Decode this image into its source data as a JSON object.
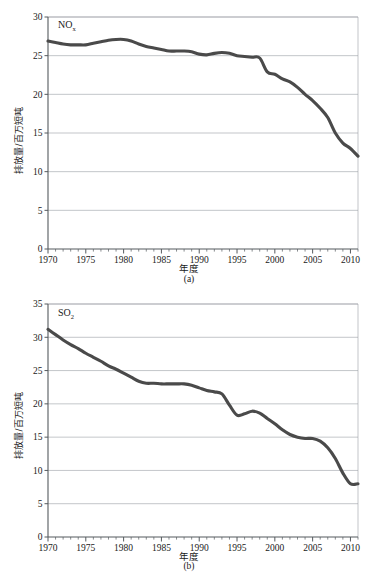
{
  "figure": {
    "panels": [
      {
        "caption": "(a)",
        "series_label_main": "NO",
        "series_label_sub": "x",
        "xlabel": "年度",
        "ylabel": "排放量/百万短吨"
      },
      {
        "caption": "(b)",
        "series_label_main": "SO",
        "series_label_sub": "2",
        "xlabel": "年度",
        "ylabel": "排放量/百万短吨"
      }
    ]
  },
  "chart_data": [
    {
      "type": "line",
      "title": "",
      "subtitle": "(a)",
      "xlabel": "年度",
      "ylabel": "排放量/百万短吨",
      "xlim": [
        1970,
        2011
      ],
      "ylim": [
        0,
        30
      ],
      "xticks": [
        1970,
        1975,
        1980,
        1985,
        1990,
        1995,
        2000,
        2005,
        2010
      ],
      "yticks": [
        0,
        5,
        10,
        15,
        20,
        25,
        30
      ],
      "xtick_minor_step": 1,
      "grid": "horizontal",
      "legend": "none",
      "annotations": [
        "NOx"
      ],
      "series": [
        {
          "name": "NOx",
          "color": "#4a4a4a",
          "x": [
            1970,
            1971,
            1972,
            1973,
            1974,
            1975,
            1976,
            1977,
            1978,
            1979,
            1980,
            1981,
            1982,
            1983,
            1984,
            1985,
            1986,
            1987,
            1988,
            1989,
            1990,
            1991,
            1992,
            1993,
            1994,
            1995,
            1996,
            1997,
            1998,
            1999,
            2000,
            2001,
            2002,
            2003,
            2004,
            2005,
            2006,
            2007,
            2008,
            2009,
            2010,
            2011
          ],
          "values": [
            26.9,
            26.7,
            26.5,
            26.4,
            26.4,
            26.4,
            26.6,
            26.8,
            27.0,
            27.1,
            27.1,
            26.9,
            26.5,
            26.2,
            26.0,
            25.8,
            25.6,
            25.6,
            25.6,
            25.5,
            25.2,
            25.1,
            25.3,
            25.4,
            25.3,
            25.0,
            24.9,
            24.8,
            24.7,
            22.9,
            22.6,
            22.0,
            21.6,
            20.9,
            20.0,
            19.2,
            18.2,
            17.0,
            15.0,
            13.7,
            13.0,
            12.0
          ]
        }
      ]
    },
    {
      "type": "line",
      "title": "",
      "subtitle": "(b)",
      "xlabel": "年度",
      "ylabel": "排放量/百万短吨",
      "xlim": [
        1970,
        2011
      ],
      "ylim": [
        0,
        35
      ],
      "xticks": [
        1970,
        1975,
        1980,
        1985,
        1990,
        1995,
        2000,
        2005,
        2010
      ],
      "yticks": [
        0,
        5,
        10,
        15,
        20,
        25,
        30,
        35
      ],
      "xtick_minor_step": 1,
      "grid": "horizontal",
      "legend": "none",
      "annotations": [
        "SO2"
      ],
      "series": [
        {
          "name": "SO2",
          "color": "#4a4a4a",
          "x": [
            1970,
            1971,
            1972,
            1973,
            1974,
            1975,
            1976,
            1977,
            1978,
            1979,
            1980,
            1981,
            1982,
            1983,
            1984,
            1985,
            1986,
            1987,
            1988,
            1989,
            1990,
            1991,
            1992,
            1993,
            1994,
            1995,
            1996,
            1997,
            1998,
            1999,
            2000,
            2001,
            2002,
            2003,
            2004,
            2005,
            2006,
            2007,
            2008,
            2009,
            2010,
            2011
          ],
          "values": [
            31.2,
            30.4,
            29.6,
            28.9,
            28.3,
            27.6,
            27.0,
            26.4,
            25.7,
            25.2,
            24.6,
            24.0,
            23.4,
            23.1,
            23.1,
            23.0,
            23.0,
            23.0,
            23.0,
            22.8,
            22.4,
            22.0,
            21.8,
            21.5,
            19.8,
            18.3,
            18.5,
            18.9,
            18.6,
            17.8,
            17.0,
            16.1,
            15.4,
            15.0,
            14.8,
            14.8,
            14.4,
            13.4,
            11.8,
            9.6,
            8.0,
            8.0
          ]
        }
      ]
    }
  ]
}
